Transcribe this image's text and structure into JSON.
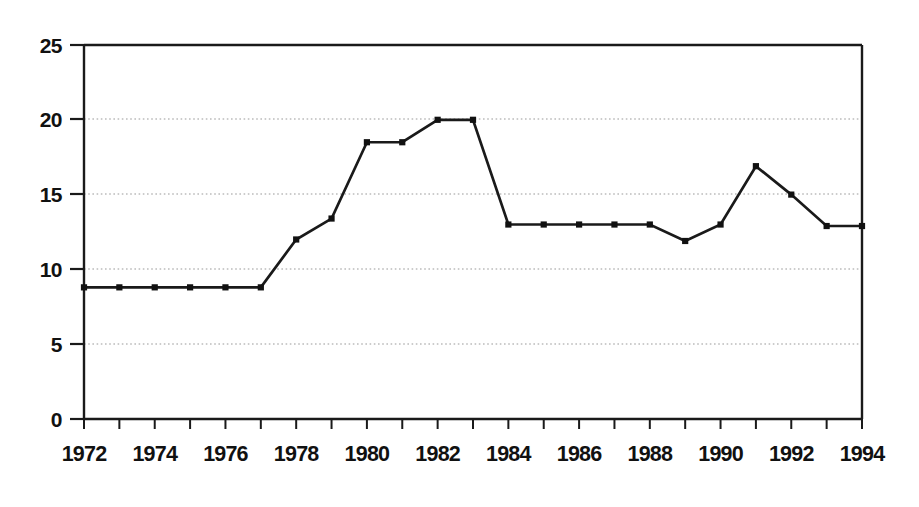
{
  "chart_data": {
    "type": "line",
    "title": "",
    "subtitle": "",
    "xlabel": "",
    "ylabel": "",
    "x": [
      1972,
      1973,
      1974,
      1975,
      1976,
      1977,
      1978,
      1979,
      1980,
      1981,
      1982,
      1983,
      1984,
      1985,
      1986,
      1987,
      1988,
      1989,
      1990,
      1991,
      1992,
      1993,
      1994
    ],
    "values": [
      8.8,
      8.8,
      8.8,
      8.8,
      8.8,
      8.8,
      12.0,
      13.4,
      18.5,
      18.5,
      20.0,
      20.0,
      13.0,
      13.0,
      13.0,
      13.0,
      13.0,
      11.9,
      13.0,
      16.9,
      15.0,
      12.9,
      12.9
    ],
    "series": [
      {
        "name": "series-1",
        "values": [
          8.8,
          8.8,
          8.8,
          8.8,
          8.8,
          8.8,
          12.0,
          13.4,
          18.5,
          18.5,
          20.0,
          20.0,
          13.0,
          13.0,
          13.0,
          13.0,
          13.0,
          11.9,
          13.0,
          16.9,
          15.0,
          12.9,
          12.9
        ]
      }
    ],
    "xlim": [
      1972,
      1994
    ],
    "ylim": [
      0,
      25
    ],
    "ytick_values": [
      0,
      5,
      10,
      15,
      20,
      25
    ],
    "ytick_labels": [
      "0",
      "5",
      "10",
      "15",
      "20",
      "25"
    ],
    "xtick_values": [
      1972,
      1973,
      1974,
      1975,
      1976,
      1977,
      1978,
      1979,
      1980,
      1981,
      1982,
      1983,
      1984,
      1985,
      1986,
      1987,
      1988,
      1989,
      1990,
      1991,
      1992,
      1993,
      1994
    ],
    "xtick_labels_shown": [
      "1972",
      "1974",
      "1976",
      "1978",
      "1980",
      "1982",
      "1984",
      "1986",
      "1988",
      "1990",
      "1992",
      "1994"
    ],
    "xtick_labeled_values": [
      1972,
      1974,
      1976,
      1978,
      1980,
      1982,
      1984,
      1986,
      1988,
      1990,
      1992,
      1994
    ],
    "grid": true,
    "grid_axis": "y",
    "grid_values": [
      5,
      10,
      15,
      20
    ],
    "legend": false,
    "legend_position": "none",
    "marker": "square",
    "line_color": "#1a1a1a",
    "marker_color": "#111111",
    "grid_color": "#9a9a9a",
    "background_color": "#ffffff",
    "annotations": []
  }
}
